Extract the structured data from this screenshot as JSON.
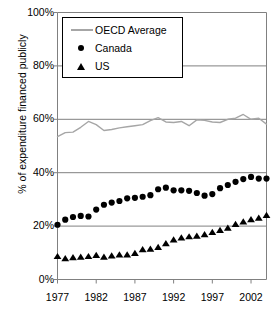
{
  "chart_data": {
    "type": "line",
    "title": "",
    "xlabel": "",
    "ylabel": "% of expenditure financed publicly",
    "ylim": [
      0,
      100
    ],
    "xlim": [
      1977,
      2004
    ],
    "grid": true,
    "legend_position": "top-left",
    "y_ticks": [
      "0%",
      "20%",
      "40%",
      "60%",
      "80%",
      "100%"
    ],
    "y_tick_values": [
      0,
      20,
      40,
      60,
      80,
      100
    ],
    "x_ticks": [
      "1977",
      "1982",
      "1987",
      "1992",
      "1997",
      "2002"
    ],
    "x_tick_values": [
      1977,
      1982,
      1987,
      1992,
      1997,
      2002
    ],
    "x": [
      1977,
      1978,
      1979,
      1980,
      1981,
      1982,
      1983,
      1984,
      1985,
      1986,
      1987,
      1988,
      1989,
      1990,
      1991,
      1992,
      1993,
      1994,
      1995,
      1996,
      1997,
      1998,
      1999,
      2000,
      2001,
      2002,
      2003,
      2004
    ],
    "series": [
      {
        "name": "OECD Average",
        "marker": "none",
        "color": "#a6a6a6",
        "values": [
          53.5,
          55.0,
          55.2,
          57.0,
          59.2,
          58.0,
          55.8,
          56.2,
          56.8,
          57.2,
          57.6,
          58.0,
          59.5,
          60.6,
          59.0,
          58.8,
          59.2,
          57.6,
          59.8,
          59.6,
          59.0,
          58.8,
          60.0,
          60.4,
          61.8,
          60.0,
          60.4,
          58.2
        ]
      },
      {
        "name": "Canada",
        "marker": "circle",
        "color": "#000000",
        "values": [
          20.5,
          22.4,
          23.4,
          23.8,
          23.6,
          26.2,
          28.0,
          28.8,
          29.4,
          30.4,
          30.6,
          31.0,
          31.6,
          33.8,
          34.4,
          33.4,
          33.4,
          33.2,
          32.4,
          31.4,
          32.0,
          34.2,
          35.4,
          36.6,
          37.6,
          38.4,
          37.8,
          37.8
        ]
      },
      {
        "name": "US",
        "marker": "triangle",
        "color": "#000000",
        "values": [
          8.8,
          8.0,
          8.4,
          8.6,
          8.8,
          9.2,
          8.6,
          9.0,
          9.4,
          9.4,
          10.0,
          11.4,
          11.6,
          12.2,
          13.6,
          15.0,
          15.8,
          16.2,
          16.4,
          17.0,
          17.8,
          18.6,
          19.4,
          20.8,
          21.8,
          22.6,
          23.2,
          24.2
        ]
      }
    ]
  },
  "legend": {
    "items": [
      {
        "label": "OECD Average"
      },
      {
        "label": "Canada"
      },
      {
        "label": "US"
      }
    ]
  }
}
